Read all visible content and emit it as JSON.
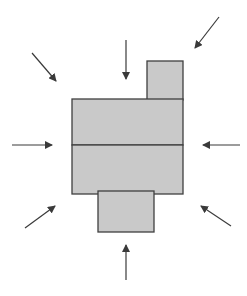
{
  "diagram": {
    "colors": {
      "fill": "#c9c9c9",
      "stroke": "#3f3f3f",
      "arrow": "#3a3a3a",
      "background": "#ffffff"
    },
    "shapes": [
      {
        "id": "top-block",
        "x": 147,
        "y": 61,
        "w": 36,
        "h": 39
      },
      {
        "id": "main-block-upper",
        "x": 72,
        "y": 99,
        "w": 111,
        "h": 46
      },
      {
        "id": "main-block-lower",
        "x": 72,
        "y": 145,
        "w": 111,
        "h": 49
      },
      {
        "id": "bottom-block",
        "x": 98,
        "y": 191,
        "w": 56,
        "h": 41
      }
    ],
    "arrows": [
      {
        "id": "arrow-top-left",
        "x1": 32,
        "y1": 53,
        "x2": 56,
        "y2": 81
      },
      {
        "id": "arrow-top",
        "x1": 126,
        "y1": 40,
        "x2": 126,
        "y2": 79
      },
      {
        "id": "arrow-top-right",
        "x1": 219,
        "y1": 17,
        "x2": 195,
        "y2": 48
      },
      {
        "id": "arrow-left",
        "x1": 12,
        "y1": 145,
        "x2": 52,
        "y2": 145
      },
      {
        "id": "arrow-right",
        "x1": 240,
        "y1": 145,
        "x2": 203,
        "y2": 145
      },
      {
        "id": "arrow-bottom-left",
        "x1": 25,
        "y1": 228,
        "x2": 55,
        "y2": 206
      },
      {
        "id": "arrow-bottom",
        "x1": 126,
        "y1": 280,
        "x2": 126,
        "y2": 245
      },
      {
        "id": "arrow-bottom-right",
        "x1": 231,
        "y1": 226,
        "x2": 201,
        "y2": 206
      }
    ]
  }
}
